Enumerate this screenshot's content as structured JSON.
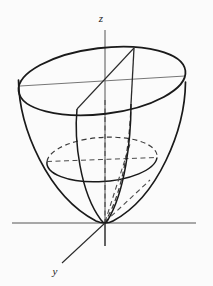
{
  "figure": {
    "background_color": "#fbfbfb",
    "stroke_color": "#1a1a1a",
    "axis_color": "#555555",
    "dashed_color": "#444444",
    "surface_type": "elliptic-paraboloid",
    "equation_implied": "z = x^2 + y^2",
    "axes": [
      {
        "name": "z-axis",
        "label": "z",
        "label_x": 101,
        "label_y": 22,
        "orientation": "vertical",
        "from_x": 105,
        "from_y": 30,
        "to_x": 105,
        "to_y": 246,
        "style": "solid"
      },
      {
        "name": "x-axis",
        "label": "",
        "orientation": "horizontal",
        "from_x": 12,
        "from_y": 223,
        "to_x": 196,
        "to_y": 223,
        "style": "solid"
      },
      {
        "name": "y-axis",
        "label": "y",
        "label_x": 55,
        "label_y": 275,
        "orientation": "diagonal-down-left",
        "from_x": 105,
        "from_y": 223,
        "to_x": 62,
        "to_y": 263,
        "style": "solid"
      },
      {
        "name": "y-axis-hidden-extension",
        "label": "",
        "orientation": "diagonal-up-right",
        "from_x": 105,
        "from_y": 223,
        "to_x": 150,
        "to_y": 181,
        "style": "dashed"
      }
    ],
    "ellipses": [
      {
        "name": "top-rim-ellipse",
        "center_x": 102,
        "center_y": 81,
        "radius_x": 84,
        "radius_y": 33,
        "rotation_deg": -7,
        "style": "solid",
        "stroke_width": 1.6
      },
      {
        "name": "mid-cross-section-ellipse",
        "center_x": 102,
        "center_y": 160,
        "radius_x": 55,
        "radius_y": 22,
        "rotation_deg": -4,
        "style": "front-solid-back-dashed",
        "stroke_width": 1.4
      }
    ],
    "guide_lines": [
      {
        "name": "top-ellipse-horizontal-chord",
        "from_x": 20,
        "from_y": 86,
        "to_x": 185,
        "to_y": 76,
        "style": "solid-thin"
      },
      {
        "name": "mid-ellipse-horizontal-chord",
        "from_x": 47,
        "from_y": 162,
        "to_x": 157,
        "to_y": 157,
        "style": "dashed"
      },
      {
        "name": "wedge-chord-top",
        "from_x": 77,
        "from_y": 109,
        "to_x": 134,
        "to_y": 48,
        "style": "solid-thin"
      },
      {
        "name": "wedge-edge-right-vertical",
        "from_x": 134,
        "from_y": 48,
        "to_x": 131,
        "to_y": 104,
        "style": "solid-thin"
      }
    ],
    "meridians": [
      {
        "name": "left-outer-meridian",
        "description": "left silhouette of paraboloid",
        "style": "solid"
      },
      {
        "name": "right-outer-meridian",
        "description": "right silhouette of paraboloid",
        "style": "solid"
      },
      {
        "name": "wedge-meridian-left",
        "description": "interior cut curve descending to vertex",
        "style": "solid"
      },
      {
        "name": "wedge-meridian-right",
        "description": "interior cut curve descending to vertex",
        "style": "solid"
      },
      {
        "name": "hidden-meridian-dashed",
        "description": "rear cut curve behind surface",
        "style": "dashed"
      }
    ],
    "vertex": {
      "name": "paraboloid-vertex",
      "x": 105,
      "y": 223
    }
  }
}
